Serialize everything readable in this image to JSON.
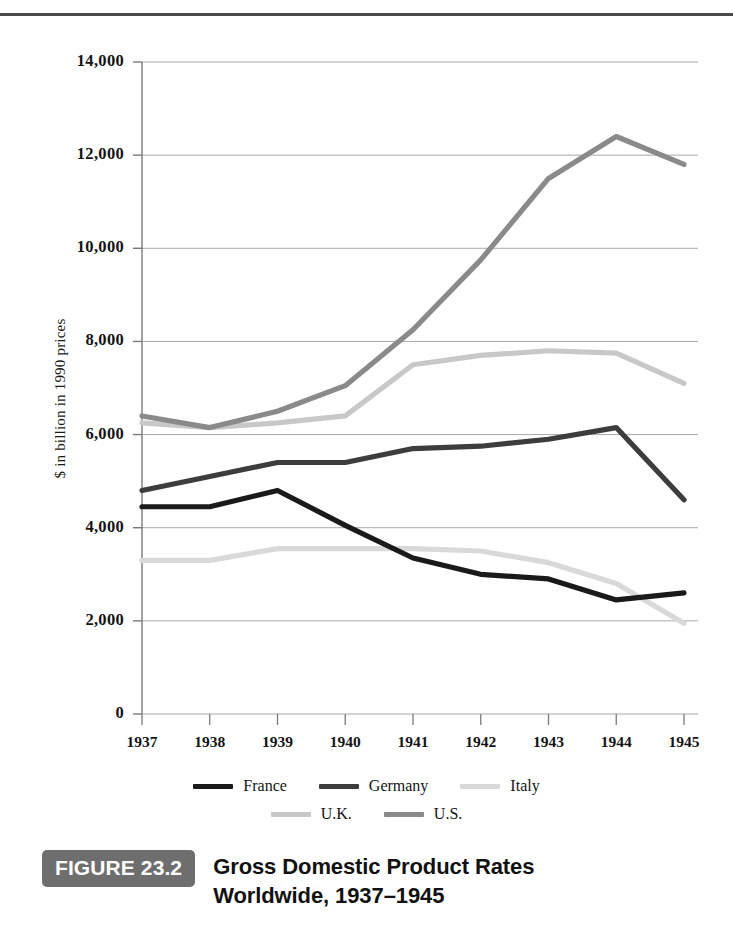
{
  "figure": {
    "badge": "FIGURE 23.2",
    "caption_line1": "Gross Domestic Product Rates",
    "caption_line2": "Worldwide, 1937–1945"
  },
  "colors": {
    "france": "#1a1a1a",
    "germany": "#3d3d3d",
    "italy": "#d9d9d9",
    "uk": "#c8c8c8",
    "us": "#8a8a8a",
    "gridline": "#a8a8a8",
    "axis": "#7a7a7a",
    "badge_bg": "#6e6e6e",
    "text": "#141414"
  },
  "chart_data": {
    "type": "line",
    "title": "Gross Domestic Product Rates Worldwide, 1937–1945",
    "xlabel": "",
    "ylabel": "$ in billion in 1990 prices",
    "x": [
      "1937",
      "1938",
      "1939",
      "1940",
      "1941",
      "1942",
      "1943",
      "1944",
      "1945"
    ],
    "categories": [
      "1937",
      "1938",
      "1939",
      "1940",
      "1941",
      "1942",
      "1943",
      "1944",
      "1945"
    ],
    "ylim": [
      0,
      14000
    ],
    "yticks": [
      0,
      2000,
      4000,
      6000,
      8000,
      10000,
      12000,
      14000
    ],
    "ytick_labels": [
      "0",
      "2,000",
      "4,000",
      "6,000",
      "8,000",
      "10,000",
      "12,000",
      "14,000"
    ],
    "grid": true,
    "legend_position": "bottom",
    "series": [
      {
        "name": "France",
        "color_key": "france",
        "values": [
          4450,
          4450,
          4800,
          4050,
          3350,
          3000,
          2900,
          2450,
          2600
        ]
      },
      {
        "name": "Germany",
        "color_key": "germany",
        "values": [
          4800,
          5100,
          5400,
          5400,
          5700,
          5750,
          5900,
          6150,
          4600
        ]
      },
      {
        "name": "Italy",
        "color_key": "italy",
        "values": [
          3300,
          3300,
          3550,
          3550,
          3550,
          3500,
          3250,
          2800,
          1950
        ]
      },
      {
        "name": "U.K.",
        "color_key": "uk",
        "values": [
          6250,
          6150,
          6250,
          6400,
          7500,
          7700,
          7800,
          7750,
          7100
        ]
      },
      {
        "name": "U.S.",
        "color_key": "us",
        "values": [
          6400,
          6150,
          6500,
          7050,
          8250,
          9750,
          11500,
          12400,
          11800
        ]
      }
    ]
  },
  "legend": {
    "row1": [
      {
        "label": "France",
        "color_key": "france"
      },
      {
        "label": "Germany",
        "color_key": "germany"
      },
      {
        "label": "Italy",
        "color_key": "italy"
      }
    ],
    "row2": [
      {
        "label": "U.K.",
        "color_key": "uk"
      },
      {
        "label": "U.S.",
        "color_key": "us"
      }
    ]
  }
}
